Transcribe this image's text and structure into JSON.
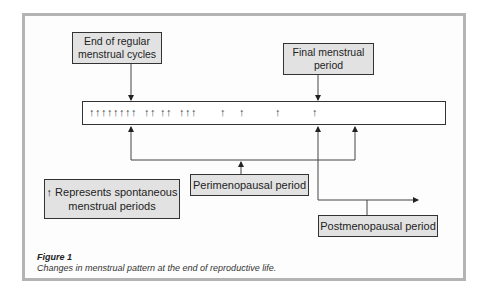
{
  "figure": {
    "title": "Figure 1",
    "caption": "Changes in menstrual pattern at the end of reproductive life."
  },
  "boxes": {
    "end_regular": "End of regular\nmenstrual cycles",
    "final_period": "Final menstrual\nperiod",
    "legend": "↑ Represents spontaneous\nmenstrual periods",
    "perimenopausal": "Perimenopausal period",
    "postmenopausal": "Postmenopausal period"
  },
  "timeline": {
    "tick_glyph": "↑",
    "ticks_x": [
      92,
      98,
      104,
      110,
      116,
      122,
      128,
      134,
      147,
      153,
      163,
      169,
      182,
      188,
      194,
      223,
      242,
      278,
      315
    ]
  },
  "colors": {
    "box_fill": "#e2e2e2",
    "box_border": "#333333",
    "frame": "#b4b4b4"
  }
}
